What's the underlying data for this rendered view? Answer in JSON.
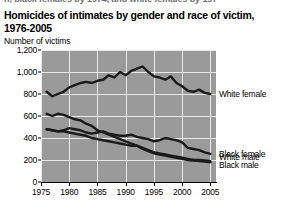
{
  "ghost_text": "n, black females by 1974, and white females by 197",
  "figure": {
    "title_line1": "Homicides of intimates by gender and race of victim,",
    "title_line2": "1976-2005",
    "axis_note": "Number of victims"
  },
  "chart_data": {
    "type": "line",
    "title": "Homicides of intimates by gender and race of victim, 1976-2005",
    "xlabel": "",
    "ylabel": "Number of victims",
    "ylim": [
      0,
      1200
    ],
    "ytick_labels": [
      "0",
      "200",
      "400",
      "600",
      "800",
      "1,000",
      "1,200"
    ],
    "yticks": [
      0,
      200,
      400,
      600,
      800,
      1000,
      1200
    ],
    "xlim": [
      1975,
      2006
    ],
    "xtick_labels": [
      "1975",
      "1980",
      "1985",
      "1990",
      "1995",
      "2000",
      "2005"
    ],
    "xticks": [
      1975,
      1980,
      1985,
      1990,
      1995,
      2000,
      2005
    ],
    "grid": true,
    "plot_background": "#9a9a9a",
    "gridline_color": "#e8e8e8",
    "line_color": "#1a1a1a",
    "legend_position": "right-of-plot (direct series labels)",
    "x": [
      1976,
      1977,
      1978,
      1979,
      1980,
      1981,
      1982,
      1983,
      1984,
      1985,
      1986,
      1987,
      1988,
      1989,
      1990,
      1991,
      1992,
      1993,
      1994,
      1995,
      1996,
      1997,
      1998,
      1999,
      2000,
      2001,
      2002,
      2003,
      2004,
      2005
    ],
    "series": [
      {
        "name": "White female",
        "label": "White female",
        "values": [
          820,
          780,
          800,
          820,
          860,
          880,
          900,
          910,
          900,
          920,
          930,
          970,
          950,
          1000,
          970,
          1010,
          1030,
          1050,
          1000,
          960,
          950,
          930,
          960,
          900,
          870,
          830,
          820,
          840,
          810,
          800
        ]
      },
      {
        "name": "Black female",
        "label": "Black female",
        "values": [
          480,
          470,
          460,
          470,
          490,
          480,
          470,
          450,
          440,
          450,
          460,
          440,
          430,
          420,
          420,
          430,
          410,
          400,
          390,
          370,
          380,
          400,
          390,
          380,
          360,
          310,
          300,
          290,
          270,
          255
        ]
      },
      {
        "name": "White male",
        "label": "White male",
        "values": [
          480,
          470,
          460,
          460,
          450,
          440,
          430,
          420,
          400,
          390,
          380,
          370,
          360,
          350,
          340,
          330,
          330,
          310,
          290,
          270,
          260,
          250,
          240,
          230,
          220,
          210,
          200,
          200,
          195,
          190
        ]
      },
      {
        "name": "Black male",
        "label": "Black male",
        "values": [
          620,
          600,
          620,
          610,
          590,
          570,
          560,
          530,
          510,
          470,
          450,
          430,
          410,
          390,
          370,
          350,
          330,
          300,
          280,
          260,
          250,
          240,
          230,
          220,
          210,
          200,
          195,
          190,
          185,
          180
        ]
      }
    ]
  }
}
